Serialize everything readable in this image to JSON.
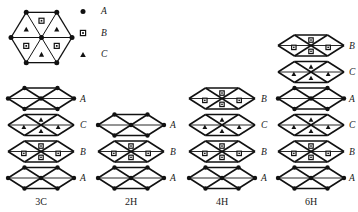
{
  "figure": {
    "title": "",
    "legend": {
      "items": [
        {
          "symbol": "filled-circle",
          "label": "A"
        },
        {
          "symbol": "dotted-square",
          "label": "B"
        },
        {
          "symbol": "filled-triangle",
          "label": "C"
        }
      ]
    },
    "hexagon": {
      "name": "basal-plane-hexagon",
      "sector_symbols": [
        "triangle",
        "square",
        "triangle",
        "square",
        "triangle",
        "square"
      ],
      "vertex_symbol": "filled-circle",
      "vertex_count": 6,
      "has_center_node": true
    },
    "stacks": [
      {
        "name": "3C",
        "label": "3C",
        "layers": [
          {
            "label": "A",
            "type": "A"
          },
          {
            "label": "C",
            "type": "C"
          },
          {
            "label": "B",
            "type": "B"
          },
          {
            "label": "A",
            "type": "A"
          }
        ]
      },
      {
        "name": "2H",
        "label": "2H",
        "layers": [
          {
            "label": "A",
            "type": "A"
          },
          {
            "label": "B",
            "type": "B"
          },
          {
            "label": "A",
            "type": "A"
          }
        ]
      },
      {
        "name": "4H",
        "label": "4H",
        "layers": [
          {
            "label": "B",
            "type": "B"
          },
          {
            "label": "C",
            "type": "C"
          },
          {
            "label": "B",
            "type": "B"
          },
          {
            "label": "A",
            "type": "A"
          }
        ]
      },
      {
        "name": "6H",
        "label": "6H",
        "layers": [
          {
            "label": "B",
            "type": "B"
          },
          {
            "label": "C",
            "type": "C"
          },
          {
            "label": "A",
            "type": "A"
          },
          {
            "label": "C",
            "type": "C"
          },
          {
            "label": "B",
            "type": "B"
          },
          {
            "label": "A",
            "type": "A"
          }
        ]
      }
    ],
    "colors": {
      "ink": "#111111",
      "background": "#ffffff"
    }
  }
}
